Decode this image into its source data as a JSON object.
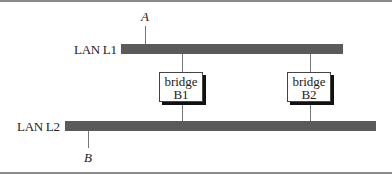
{
  "diagram": {
    "lans": [
      {
        "id": "L1",
        "label": "LAN L1"
      },
      {
        "id": "L2",
        "label": "LAN L2"
      }
    ],
    "bridges": [
      {
        "id": "B1",
        "line1": "bridge",
        "line2": "B1",
        "connects": [
          "L1",
          "L2"
        ]
      },
      {
        "id": "B2",
        "line1": "bridge",
        "line2": "B2",
        "connects": [
          "L1",
          "L2"
        ]
      }
    ],
    "hosts": [
      {
        "id": "A",
        "label": "A",
        "lan": "L1"
      },
      {
        "id": "B",
        "label": "B",
        "lan": "L2"
      }
    ],
    "colors": {
      "lan_bar": "#5a5a5a",
      "frame": "#8a8a8a",
      "bridge_shadow": "#111111"
    }
  }
}
